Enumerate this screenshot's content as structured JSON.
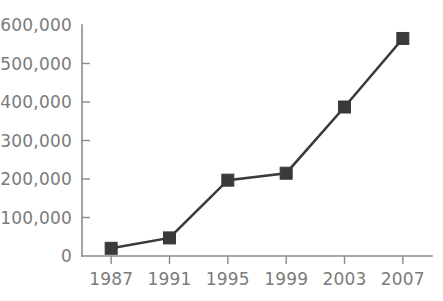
{
  "chart_data": {
    "type": "line",
    "title": "",
    "subtitle": "",
    "xlabel": "",
    "ylabel": "",
    "categories": [
      "1987",
      "1991",
      "1995",
      "1999",
      "2003",
      "2007"
    ],
    "x": [
      1987,
      1991,
      1995,
      1999,
      2003,
      2007
    ],
    "values": [
      20000,
      47000,
      197000,
      215000,
      387000,
      565000
    ],
    "series": [
      {
        "name": "",
        "values": [
          20000,
          47000,
          197000,
          215000,
          387000,
          565000
        ]
      }
    ],
    "ylim": [
      0,
      600000
    ],
    "y_ticks": [
      0,
      100000,
      200000,
      300000,
      400000,
      500000,
      600000
    ],
    "y_tick_labels": [
      "0",
      "100,000",
      "200,000",
      "300,000",
      "400,000",
      "500,000",
      "600,000"
    ],
    "x_tick_labels": [
      "1987",
      "1991",
      "1995",
      "1999",
      "2003",
      "2007"
    ],
    "grid": false,
    "legend": false,
    "legend_position": "none",
    "marker": "square",
    "annotations": [],
    "colors": {
      "series_line": "#3a3a3a",
      "marker": "#3a3a3a",
      "axis": "#8c8c8c",
      "tick_label": "#7b7b7b",
      "background": "#ffffff"
    }
  }
}
